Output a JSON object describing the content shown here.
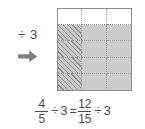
{
  "figure": {
    "operator_block": {
      "label": "÷ 3",
      "arrow_icon": "right-arrow-icon",
      "arrow_color": "#7f7f7f"
    },
    "grid": {
      "columns": 3,
      "rows": 5,
      "total_cells": 15,
      "shaded_cells": 12,
      "hatched_cells": 4,
      "border_color": "#8d8d8d",
      "gridline_color": "#9a9a9a",
      "shade_color": "#cccccc",
      "hatch_color": "#8f8f8f",
      "cells": [
        "none",
        "none",
        "none",
        "hatch",
        "solid",
        "solid",
        "hatch",
        "solid",
        "solid",
        "hatch",
        "solid",
        "solid",
        "hatch",
        "solid",
        "solid"
      ]
    },
    "equation": {
      "left_fraction": {
        "numerator": "4",
        "denominator": "5"
      },
      "divide_symbol_1": "÷",
      "divisor_1": "3",
      "equals": "=",
      "right_fraction": {
        "numerator": "12",
        "denominator": "15"
      },
      "divide_symbol_2": "÷",
      "divisor_2": "3",
      "plain_text": "4/5 ÷ 3 = 12/15 ÷ 3"
    }
  }
}
